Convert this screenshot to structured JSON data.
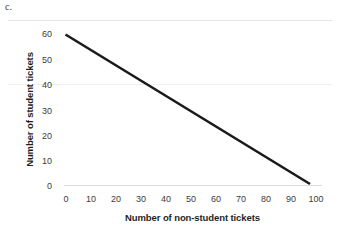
{
  "part_label": "c.",
  "chart_data": {
    "type": "line",
    "title": "",
    "xlabel": "Number of non-student tickets",
    "ylabel": "Number of student tickets",
    "xlim": [
      0,
      100
    ],
    "ylim": [
      0,
      60
    ],
    "xticks": [
      0,
      10,
      20,
      30,
      40,
      50,
      60,
      70,
      80,
      90,
      100
    ],
    "yticks": [
      0,
      10,
      20,
      30,
      40,
      50,
      60
    ],
    "grid": "horizontal-light",
    "legend": "none",
    "series": [
      {
        "name": "ticket constraint line",
        "x": [
          0,
          100
        ],
        "values": [
          60,
          0
        ],
        "color": "#1a1a1a",
        "width": 2.6
      }
    ],
    "annotations": []
  },
  "style": {
    "line_color": "#1a1a1a",
    "gridline_color": "#e8e8e8",
    "axis_color": "#dcdcdc",
    "text_color": "#2b2b2b",
    "background": "#ffffff"
  }
}
